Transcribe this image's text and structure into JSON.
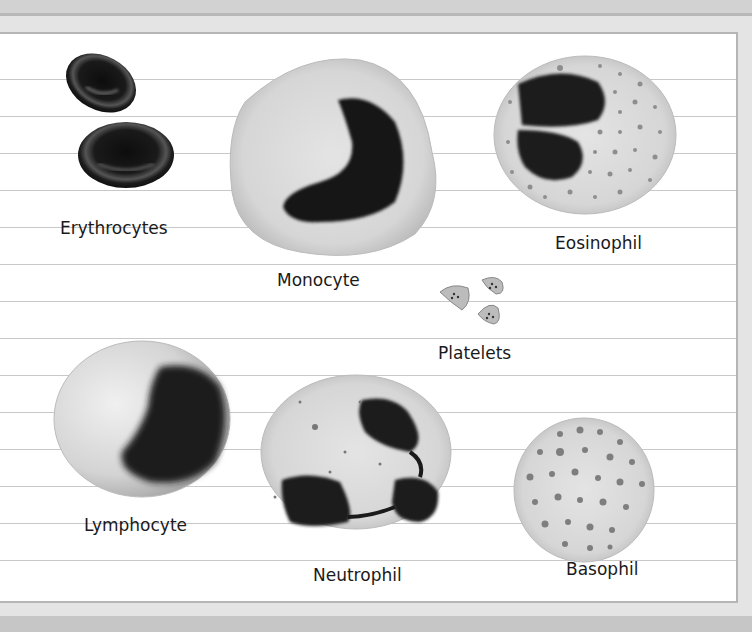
{
  "figure": {
    "background": "#ffffff",
    "rule_color": "#c8c8c8",
    "frame_color": "#d4d4d4"
  },
  "cells": [
    {
      "id": "erythrocytes",
      "label": "Erythrocytes"
    },
    {
      "id": "monocyte",
      "label": "Monocyte"
    },
    {
      "id": "eosinophil",
      "label": "Eosinophil"
    },
    {
      "id": "platelets",
      "label": "Platelets"
    },
    {
      "id": "lymphocyte",
      "label": "Lymphocyte"
    },
    {
      "id": "neutrophil",
      "label": "Neutrophil"
    },
    {
      "id": "basophil",
      "label": "Basophil"
    }
  ]
}
